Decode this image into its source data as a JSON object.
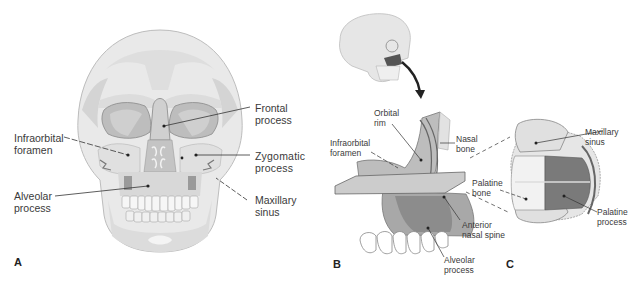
{
  "figure": {
    "panels": [
      {
        "id": "A",
        "letter": "A",
        "view": "anterior skull",
        "labels": {
          "infraorbital_foramen": "Infraorbital\nforamen",
          "alveolar_process": "Alveolar\nprocess",
          "frontal_process": "Frontal\nprocess",
          "zygomatic_process": "Zygomatic\nprocess",
          "maxillary_sinus": "Maxillary\nsinus"
        }
      },
      {
        "id": "B",
        "letter": "B",
        "view": "maxilla lateral cutaway",
        "labels": {
          "orbital_rim": "Orbital\nrim",
          "infraorbital_foramen": "Infraorbital\nforamen",
          "nasal_bone": "Nasal\nbone",
          "anterior_nasal_spine": "Anterior\nnasal spine",
          "alveolar_process": "Alveolar\nprocess"
        }
      },
      {
        "id": "C",
        "letter": "C",
        "view": "horizontal section",
        "labels": {
          "maxillary_sinus": "Maxillary\nsinus",
          "palatine_bone": "Palatine\nbone",
          "palatine_process": "Palatine\nprocess"
        }
      }
    ],
    "colors": {
      "bone_light": "#ececec",
      "bone_mid": "#d6d6d6",
      "bone_shadow": "#b8b8b8",
      "bone_dark": "#7a7a7a",
      "highlight_dark": "#555555",
      "leader_line": "#333333"
    }
  }
}
